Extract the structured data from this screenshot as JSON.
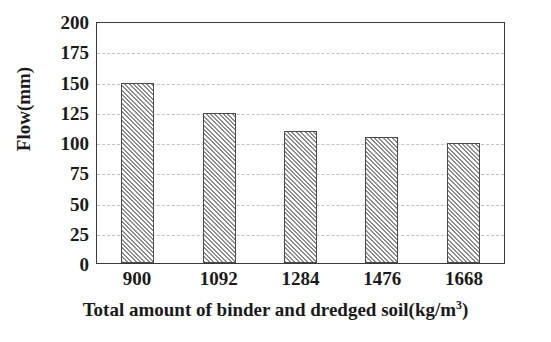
{
  "chart_data": {
    "type": "bar",
    "title": "",
    "categories": [
      "900",
      "1092",
      "1284",
      "1476",
      "1668"
    ],
    "values": [
      150,
      125,
      110,
      105,
      100
    ],
    "series": [
      {
        "name": "Flow",
        "values": [
          150,
          125,
          110,
          105,
          100
        ]
      }
    ],
    "xlabel": "Total amount of binder and dredged soil(kg/m",
    "xlabel_superscript": "3",
    "xlabel_suffix": ")",
    "xlabel_full": "Total amount of binder and dredged soil(kg/m3)",
    "ylabel": "Flow(mm)",
    "ylim": [
      0,
      200
    ],
    "ytick_labels": [
      "0",
      "25",
      "50",
      "75",
      "100",
      "125",
      "150",
      "175",
      "200"
    ],
    "ytick_values": [
      0,
      25,
      50,
      75,
      100,
      125,
      150,
      175,
      200
    ],
    "ytick_step": 25,
    "grid": true,
    "grid_axis": "y",
    "grid_style": "dashed",
    "legend": "none",
    "bar_fill": "diagonal-hatch",
    "colors": {
      "hatch": "#8c8c8c",
      "bar_background": "#ffffff",
      "bar_border": "#4a4a4a",
      "gridline": "#c2c2c2",
      "axis": "#3b3b3b",
      "text": "#1a1a1a",
      "plot_background": "#ffffff"
    }
  }
}
